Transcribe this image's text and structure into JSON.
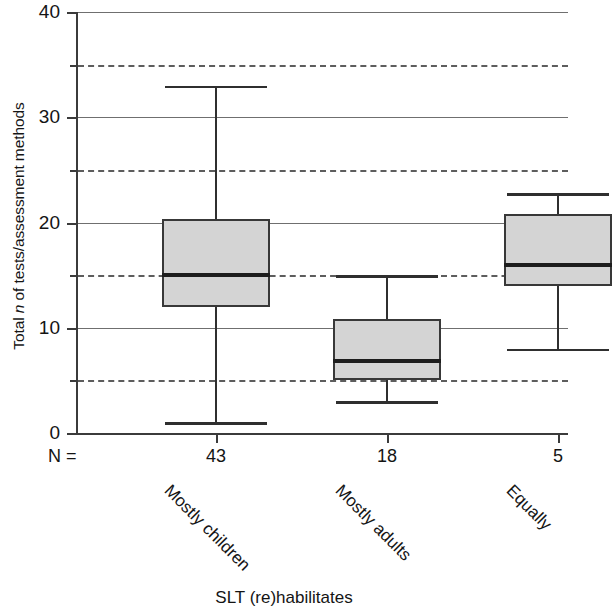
{
  "chart_data": {
    "type": "box",
    "title": "",
    "xlabel": "SLT (re)habilitates",
    "ylabel": "Total n of tests/assessment methods",
    "ylabel_parts": {
      "pre": "Total ",
      "italic": "n",
      "post": " of tests/assessment methods"
    },
    "ylim": [
      0,
      40
    ],
    "y_ticks": [
      "0",
      "10",
      "20",
      "30",
      "40"
    ],
    "y_tick_values": [
      0,
      10,
      20,
      30,
      40
    ],
    "y_gridlines_dashed": [
      5,
      15,
      25,
      35
    ],
    "grid": true,
    "legend": "none",
    "n_label": "N =",
    "categories": [
      "Mostly children",
      "Mostly adults",
      "Equally"
    ],
    "n_values": [
      "43",
      "18",
      "5"
    ],
    "boxes": [
      {
        "category": "Mostly children",
        "n": "43",
        "whisker_low": 1,
        "q1": 12,
        "median": 15,
        "q3": 20.3,
        "whisker_high": 33
      },
      {
        "category": "Mostly adults",
        "n": "18",
        "whisker_low": 3,
        "q1": 5,
        "median": 6.8,
        "q3": 10.8,
        "whisker_high": 15
      },
      {
        "category": "Equally",
        "n": "5",
        "whisker_low": 8,
        "q1": 14,
        "median": 16,
        "q3": 20.8,
        "whisker_high": 22.8
      }
    ],
    "colors": {
      "box_fill": "#d4d4d4",
      "box_border": "#383838",
      "median": "#1d1d1d",
      "whisker": "#2f2f2f",
      "gridline_solid": "#6f6f6f",
      "gridline_dashed": "#5d5d5d",
      "axis": "#3b3b3b",
      "text": "#141414",
      "background": "#ffffff"
    }
  }
}
